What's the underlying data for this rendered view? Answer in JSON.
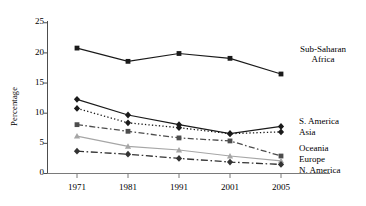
{
  "chart_data": {
    "type": "line",
    "title": "",
    "xlabel": "",
    "ylabel": "Percentage",
    "categories": [
      "1971",
      "1981",
      "1991",
      "2001",
      "2005"
    ],
    "x_tick_labels": [
      "1971",
      "1981",
      "1991",
      "2001",
      "2005"
    ],
    "y_tick_labels": [
      "0",
      "5",
      "10",
      "15",
      "20",
      "25"
    ],
    "y_ticks": [
      0,
      5,
      10,
      15,
      20,
      25
    ],
    "ylim": [
      0,
      25
    ],
    "grid": false,
    "legend_position": "right-inline-labels",
    "series": [
      {
        "name": "Sub-Saharan Africa",
        "label": "Sub-Saharan Africa",
        "label_line1": "Sub-Saharan",
        "label_line2": "Africa",
        "color": "#1a1a1a",
        "marker": "square",
        "dash": "none",
        "values": [
          20.8,
          18.6,
          19.9,
          19.1,
          16.5
        ]
      },
      {
        "name": "S. America",
        "label": "S. America",
        "color": "#1a1a1a",
        "marker": "diamond",
        "dash": "none",
        "values": [
          12.3,
          9.7,
          8.1,
          6.6,
          7.8
        ]
      },
      {
        "name": "Asia",
        "label": "Asia",
        "color": "#1a1a1a",
        "marker": "diamond",
        "dash": "dotted",
        "values": [
          10.8,
          8.4,
          7.6,
          6.6,
          6.9
        ]
      },
      {
        "name": "Oceania",
        "label": "Oceania",
        "color": "#4d4d4d",
        "marker": "square",
        "dash": "dash-dot",
        "values": [
          8.1,
          7.0,
          5.9,
          5.4,
          2.9
        ]
      },
      {
        "name": "Europe",
        "label": "Europe",
        "color": "#a6a6a6",
        "marker": "triangle",
        "dash": "none",
        "values": [
          6.2,
          4.5,
          3.9,
          2.9,
          2.1
        ]
      },
      {
        "name": "N. America",
        "label": "N. America",
        "color": "#333333",
        "marker": "diamond",
        "dash": "long-dash-dot",
        "values": [
          3.7,
          3.2,
          2.5,
          1.9,
          1.5
        ]
      }
    ]
  },
  "axes": {
    "y_axis_label": "Percentage"
  }
}
